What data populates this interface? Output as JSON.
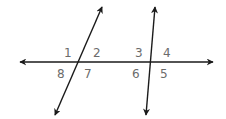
{
  "diagram": {
    "line_color": "#1a1a1a",
    "label_color": "#6b6b6b",
    "horizontal_line": {
      "x1": 20,
      "y1": 62,
      "x2": 213,
      "y2": 62
    },
    "transversal_left": {
      "x1": 102,
      "y1": 7,
      "x2": 55,
      "y2": 115
    },
    "transversal_right": {
      "x1": 155,
      "y1": 7,
      "x2": 146,
      "y2": 115
    },
    "angle_labels": [
      {
        "id": "1",
        "text": "1",
        "x": 64,
        "y": 57
      },
      {
        "id": "2",
        "text": "2",
        "x": 93,
        "y": 57
      },
      {
        "id": "3",
        "text": "3",
        "x": 135,
        "y": 57
      },
      {
        "id": "4",
        "text": "4",
        "x": 163,
        "y": 57
      },
      {
        "id": "8",
        "text": "8",
        "x": 57,
        "y": 78
      },
      {
        "id": "7",
        "text": "7",
        "x": 84,
        "y": 78
      },
      {
        "id": "6",
        "text": "6",
        "x": 132,
        "y": 78
      },
      {
        "id": "5",
        "text": "5",
        "x": 160,
        "y": 78
      }
    ]
  }
}
